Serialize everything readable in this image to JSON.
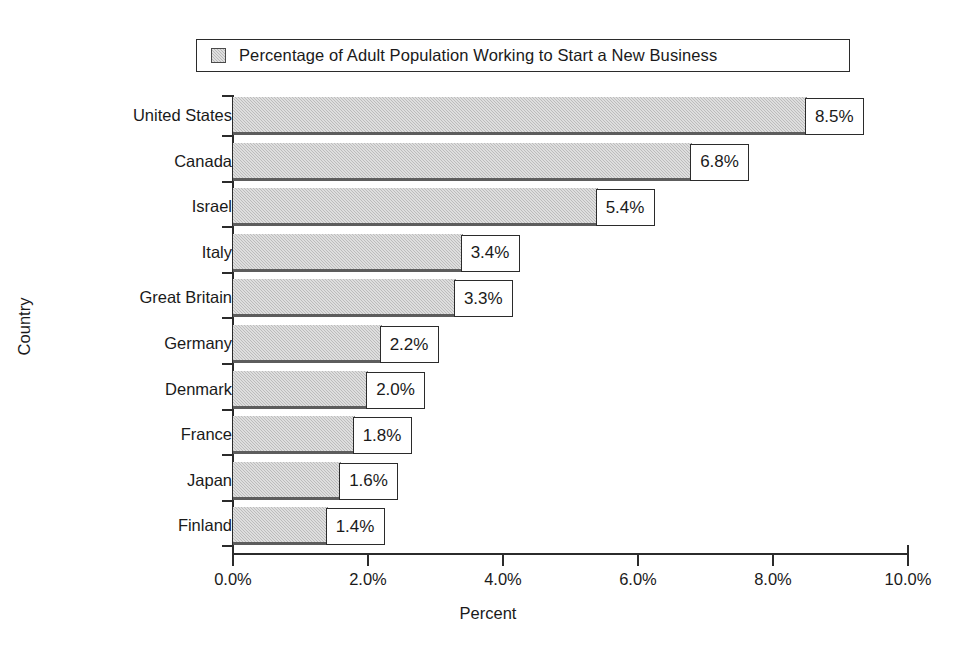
{
  "legend": {
    "swatch_icon": "bar-swatch-icon",
    "label": "Percentage of Adult Population Working to Start a New Business"
  },
  "axes": {
    "x_title": "Percent",
    "y_title": "Country",
    "x_ticks": [
      "0.0%",
      "2.0%",
      "4.0%",
      "6.0%",
      "8.0%",
      "10.0%"
    ]
  },
  "chart_data": {
    "type": "bar",
    "orientation": "horizontal",
    "title": "",
    "subtitle": "",
    "xlabel": "Percent",
    "ylabel": "Country",
    "xlim": [
      0,
      10
    ],
    "xtick_step": 2,
    "xtick_labels": [
      "0.0%",
      "2.0%",
      "4.0%",
      "6.0%",
      "8.0%",
      "10.0%"
    ],
    "grid": false,
    "legend_position": "top",
    "legend_entries": [
      "Percentage of Adult Population Working to Start a New Business"
    ],
    "categories": [
      "United States",
      "Canada",
      "Israel",
      "Italy",
      "Great Britain",
      "Germany",
      "Denmark",
      "France",
      "Japan",
      "Finland"
    ],
    "values": [
      8.5,
      6.8,
      5.4,
      3.4,
      3.3,
      2.2,
      2.0,
      1.8,
      1.6,
      1.4
    ],
    "value_labels": [
      "8.5%",
      "6.8%",
      "5.4%",
      "3.4%",
      "3.3%",
      "2.2%",
      "2.0%",
      "1.8%",
      "1.6%",
      "1.4%"
    ],
    "series": [
      {
        "name": "Percentage of Adult Population Working to Start a New Business",
        "values": [
          8.5,
          6.8,
          5.4,
          3.4,
          3.3,
          2.2,
          2.0,
          1.8,
          1.6,
          1.4
        ],
        "color": "#bcbcbc"
      }
    ]
  },
  "colors": {
    "bar_fill": "#bcbcbc",
    "bar_edge": "#5d5d5d",
    "axis": "#2b2b2b",
    "text": "#1a1a1a",
    "background": "#ffffff"
  }
}
